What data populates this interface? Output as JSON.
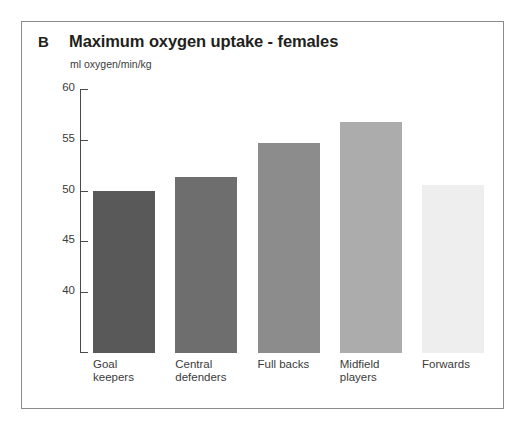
{
  "panel": {
    "letter": "B",
    "title": "Maximum oxygen uptake - females",
    "unit_label": "ml oxygen/min/kg"
  },
  "chart_data": {
    "type": "bar",
    "title": "Maximum oxygen uptake - females",
    "xlabel": "",
    "ylabel": "ml oxygen/min/kg",
    "ylim": [
      34.0,
      60.0
    ],
    "yticks": [
      40,
      45,
      50,
      55,
      60
    ],
    "ytick_labels": [
      "40",
      "45",
      "50",
      "55",
      "60"
    ],
    "grid": false,
    "legend": "none",
    "categories": [
      "Goal\nkeepers",
      "Central\ndefenders",
      "Full backs",
      "Midfield\nplayers",
      "Forwards"
    ],
    "values": [
      50.0,
      51.3,
      54.7,
      56.8,
      50.5
    ],
    "bar_colors": [
      "#595959",
      "#6e6e6e",
      "#8c8c8c",
      "#acacac",
      "#eeeeee"
    ]
  },
  "colors": {
    "frame": "#8a8a8f",
    "axis": "#4a4a4a",
    "text": "#231f20",
    "tick_text": "#3b3b3b",
    "background": "#ffffff"
  }
}
